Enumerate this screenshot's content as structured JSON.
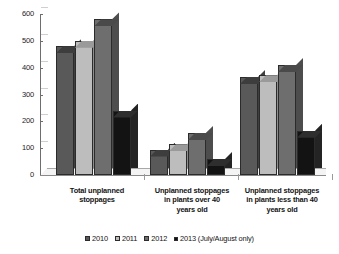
{
  "chart_data": {
    "type": "bar",
    "title": "",
    "subtitle": "",
    "xlabel": "",
    "ylabel": "",
    "ylim": [
      0,
      600
    ],
    "yticks": [
      0,
      100,
      200,
      300,
      400,
      500,
      600
    ],
    "grid": false,
    "legend_position": "bottom",
    "style": "3d-grouped-bar-grayscale",
    "categories": [
      "Total unplanned stoppages",
      "Unplanned stoppages in plants over 40 years old",
      "Unplanned stoppages in plants less than 40 years old"
    ],
    "category_label_lines": [
      [
        "Total unplanned",
        "stoppages"
      ],
      [
        "Unplanned stoppages",
        "in plants over 40",
        "years old"
      ],
      [
        "Unplanned stoppages",
        "in plants less than 40",
        "years old"
      ]
    ],
    "series": [
      {
        "name": "2010",
        "color": "#595959",
        "values": [
          480,
          95,
          365
        ]
      },
      {
        "name": "2011",
        "color": "#bdbdbd",
        "values": [
          500,
          115,
          372
        ]
      },
      {
        "name": "2012",
        "color": "#6e6e6e",
        "values": [
          580,
          157,
          410
        ]
      },
      {
        "name": "2013 (July/August only)",
        "color": "#111111",
        "values": [
          240,
          60,
          165
        ]
      }
    ]
  },
  "legend": {
    "items": [
      {
        "label": "2010"
      },
      {
        "label": "2011"
      },
      {
        "label": "2012"
      },
      {
        "label": "2013 (July/August only)"
      }
    ]
  },
  "axis": {
    "y_tick_labels": [
      "600",
      "500",
      "400",
      "300",
      "200",
      "100",
      "0"
    ]
  }
}
